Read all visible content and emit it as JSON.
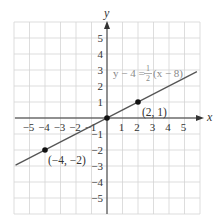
{
  "chart_data": {
    "type": "line",
    "title": "",
    "xlabel": "x",
    "ylabel": "y",
    "xlim": [
      -6,
      6
    ],
    "ylim": [
      -6,
      6
    ],
    "grid": true,
    "x_ticks": [
      -5,
      -4,
      -3,
      -2,
      -1,
      1,
      2,
      3,
      4,
      5
    ],
    "y_ticks": [
      5,
      4,
      3,
      2,
      1,
      -1,
      -2,
      -3,
      -4,
      -5
    ],
    "x_tick_labels": [
      "−5",
      "−4",
      "−3",
      "−2",
      "−1",
      "1",
      "2",
      "3",
      "4",
      "5"
    ],
    "y_tick_labels": [
      "5",
      "4",
      "3",
      "2",
      "1",
      "−1",
      "−2",
      "−3",
      "−4",
      "−5"
    ],
    "series": [
      {
        "name": "y − 4 = 1/2 (x − 8)",
        "equation": {
          "lhs": "y − 4 =",
          "frac_num": "1",
          "frac_den": "2",
          "rhs": "(x − 8)"
        },
        "slope": 0.5,
        "intercept": 0,
        "x": [
          -5.9,
          5.8
        ],
        "y": [
          -2.95,
          2.9
        ],
        "color": "#555555"
      }
    ],
    "points": [
      {
        "x": -4,
        "y": -2,
        "label": "(−4, −2)"
      },
      {
        "x": 0,
        "y": 0,
        "label": ""
      },
      {
        "x": 2,
        "y": 1,
        "label": "(2, 1)"
      }
    ],
    "legend": null
  },
  "colors": {
    "grid": "#d4d4d4",
    "axis": "#333333",
    "line": "#555555",
    "equation": "#8a8a8a",
    "point": "#111111"
  }
}
